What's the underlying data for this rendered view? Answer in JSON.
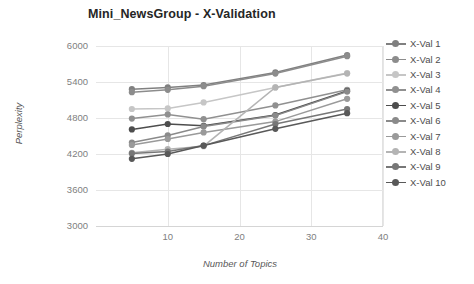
{
  "chart_data": {
    "type": "line",
    "title": "Mini_NewsGroup - X-Validation",
    "xlabel": "Number of Topics",
    "ylabel": "Perplexity",
    "x": [
      5,
      10,
      15,
      25,
      35
    ],
    "xlim": [
      0,
      40
    ],
    "ylim": [
      3000,
      6000
    ],
    "xticks": [
      10,
      20,
      30,
      40
    ],
    "yticks": [
      3000,
      3600,
      4200,
      4800,
      5400,
      6000
    ],
    "grid": true,
    "legend_position": "right",
    "marker": "circle",
    "series": [
      {
        "name": "X-Val 1",
        "color": "#808080",
        "values": [
          5280,
          5310,
          5350,
          5560,
          5850
        ]
      },
      {
        "name": "X-Val 2",
        "color": "#8c8c8c",
        "values": [
          5230,
          5270,
          5330,
          5540,
          5830
        ]
      },
      {
        "name": "X-Val 3",
        "color": "#c6c6c6",
        "values": [
          4950,
          4960,
          5060,
          5310,
          5550
        ]
      },
      {
        "name": "X-Val 4",
        "color": "#909090",
        "values": [
          4790,
          4860,
          4780,
          5010,
          5270
        ]
      },
      {
        "name": "X-Val 5",
        "color": "#4d4d4d",
        "values": [
          4610,
          4700,
          4670,
          4850,
          5250
        ]
      },
      {
        "name": "X-Val 6",
        "color": "#8a8a8a",
        "values": [
          4390,
          4510,
          4660,
          4840,
          5240
        ]
      },
      {
        "name": "X-Val 7",
        "color": "#9a9a9a",
        "values": [
          4350,
          4450,
          4560,
          4740,
          5120
        ]
      },
      {
        "name": "X-Val 8",
        "color": "#b4b4b4",
        "values": [
          4220,
          4280,
          4330,
          5310,
          5540
        ]
      },
      {
        "name": "X-Val 9",
        "color": "#777777",
        "values": [
          4210,
          4240,
          4340,
          4700,
          4950
        ]
      },
      {
        "name": "X-Val 10",
        "color": "#595959",
        "values": [
          4120,
          4200,
          4340,
          4620,
          4880
        ]
      }
    ]
  }
}
